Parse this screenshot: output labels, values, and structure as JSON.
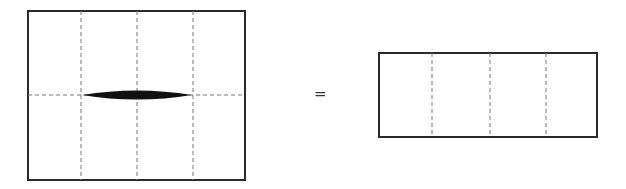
{
  "diagram": {
    "left_panel": {
      "box": {
        "x": 28,
        "y": 11,
        "w": 217,
        "h": 169
      },
      "vertical_dashed_x": [
        81,
        137,
        193
      ],
      "horizontal_dashed_y": 95,
      "lens": {
        "x1": 82,
        "x2": 192,
        "cy": 95,
        "half_thickness": 4.5
      }
    },
    "operator": "=",
    "right_panel": {
      "box": {
        "x": 379,
        "y": 53,
        "w": 218,
        "h": 84
      },
      "vertical_dashed_x": [
        432,
        490,
        546
      ]
    },
    "colors": {
      "stroke": "#2a2a2a",
      "dash": "#777777",
      "fill": "#111111"
    }
  }
}
